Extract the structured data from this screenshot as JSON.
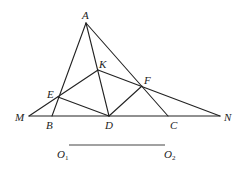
{
  "diagram": {
    "type": "geometry",
    "colors": {
      "stroke": "#222222",
      "background": "#ffffff"
    },
    "points": {
      "A": {
        "label": "A",
        "x": 86,
        "y": 23
      },
      "K": {
        "label": "K",
        "x": 98,
        "y": 70
      },
      "E": {
        "label": "E",
        "x": 58,
        "y": 97
      },
      "F": {
        "label": "F",
        "x": 142,
        "y": 86
      },
      "M": {
        "label": "M",
        "x": 29,
        "y": 116
      },
      "B": {
        "label": "B",
        "x": 52,
        "y": 116
      },
      "D": {
        "label": "D",
        "x": 109,
        "y": 116
      },
      "C": {
        "label": "C",
        "x": 168,
        "y": 116
      },
      "N": {
        "label": "N",
        "x": 220,
        "y": 116
      }
    },
    "segments": [
      [
        "A",
        "B"
      ],
      [
        "A",
        "C"
      ],
      [
        "A",
        "D"
      ],
      [
        "M",
        "N"
      ],
      [
        "M",
        "K"
      ],
      [
        "K",
        "N"
      ],
      [
        "E",
        "D"
      ],
      [
        "D",
        "F"
      ]
    ],
    "reference_segment": {
      "start_label": "O",
      "start_sub": "1",
      "end_label": "O",
      "end_sub": "2"
    }
  }
}
